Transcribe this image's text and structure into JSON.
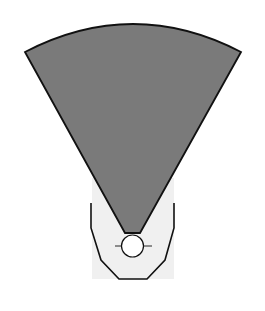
{
  "diagram": {
    "colors": {
      "background": "#ffffff",
      "sector_fill": "#7a7a7a",
      "sector_stroke": "#111111",
      "housing_fill": "#f0f0f0",
      "housing_stroke": "#111111",
      "source_fill": "#ffffff"
    },
    "elements": [
      {
        "id": "sector",
        "label": "",
        "shape": "circular-sector"
      },
      {
        "id": "housing",
        "label": "",
        "shape": "polygon-bracket"
      },
      {
        "id": "source",
        "label": "",
        "shape": "circle"
      },
      {
        "id": "crosshair",
        "label": "",
        "shape": "line"
      }
    ]
  }
}
